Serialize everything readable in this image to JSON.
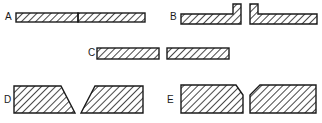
{
  "figure": {
    "colors": {
      "ink": "#1a1a1a",
      "background": "#ffffff"
    },
    "joints": [
      {
        "label": "A",
        "type": "square-butt-closed"
      },
      {
        "label": "B",
        "type": "flanged-edge"
      },
      {
        "label": "C",
        "type": "square-butt-open"
      },
      {
        "label": "D",
        "type": "single-bevel-V"
      },
      {
        "label": "E",
        "type": "chamfered-V"
      }
    ]
  }
}
